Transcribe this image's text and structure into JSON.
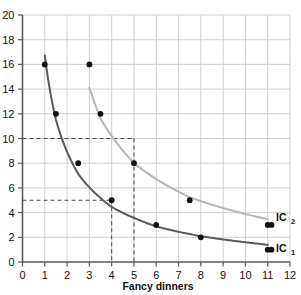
{
  "chart_data": {
    "type": "line",
    "title": "",
    "xlabel": "Fancy dinners",
    "ylabel": "",
    "xlim": [
      0,
      12
    ],
    "ylim": [
      0,
      20
    ],
    "grid": true,
    "legend_position": "inline-right",
    "x_ticks": [
      "0",
      "1",
      "2",
      "3",
      "4",
      "5",
      "6",
      "7",
      "8",
      "9",
      "10",
      "11",
      "12"
    ],
    "y_ticks": [
      "0",
      "2",
      "4",
      "6",
      "8",
      "10",
      "12",
      "14",
      "16",
      "18",
      "20"
    ],
    "series": [
      {
        "name": "IC1",
        "label_base": "IC",
        "label_sub": "1",
        "color": "#5a5a5a",
        "points": [
          {
            "x": 1,
            "y": 16
          },
          {
            "x": 1.5,
            "y": 12
          },
          {
            "x": 2.5,
            "y": 8
          },
          {
            "x": 4,
            "y": 5
          },
          {
            "x": 6,
            "y": 3
          },
          {
            "x": 8,
            "y": 2
          },
          {
            "x": 11,
            "y": 1
          }
        ]
      },
      {
        "name": "IC2",
        "label_base": "IC",
        "label_sub": "2",
        "color": "#b5b5b5",
        "points": [
          {
            "x": 3,
            "y": 16
          },
          {
            "x": 3.5,
            "y": 12
          },
          {
            "x": 5,
            "y": 8
          },
          {
            "x": 7.5,
            "y": 5
          },
          {
            "x": 11,
            "y": 3
          }
        ]
      }
    ],
    "annotations": [
      {
        "name": "guide-ic2",
        "type": "dashed-guide",
        "x": 5,
        "y": 10
      },
      {
        "name": "guide-ic1",
        "type": "dashed-guide",
        "x": 4,
        "y": 5
      }
    ],
    "colors": {
      "grid": "#c9c9c9",
      "axis": "#5a5a5a",
      "marker": "#111111",
      "dashed": "#4a4a4a",
      "ic1": "#5a5a5a",
      "ic2": "#b5b5b5"
    }
  },
  "labels": {
    "xlabel": "Fancy dinners",
    "ic1_base": "IC",
    "ic1_sub": "1",
    "ic2_base": "IC",
    "ic2_sub": "2"
  },
  "top_artifact": ""
}
